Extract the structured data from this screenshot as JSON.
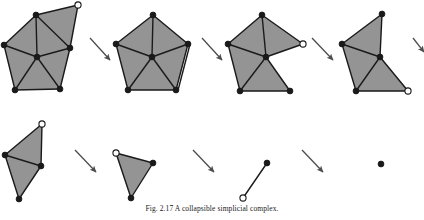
{
  "figure": {
    "caption": "Fig. 2.17  A collapsible simplicial complex.",
    "caption_clipped": true,
    "background": "#ffffff",
    "face_fill": "#949494",
    "edge_color": "#1a1a1a",
    "vertex_fill_color": "#1a1a1a",
    "vertex_hollow_fill": "#ffffff",
    "arrow_color": "#4d4d4d"
  },
  "panels": [
    {
      "name": "panel-1",
      "label": "step-1",
      "vertices": [
        {
          "id": "v-top-apex",
          "x": 36,
          "y": 15,
          "type": "filled"
        },
        {
          "id": "v-free-top-right",
          "x": 78,
          "y": 5,
          "type": "hollow"
        },
        {
          "id": "v-right",
          "x": 70,
          "y": 48,
          "type": "filled"
        },
        {
          "id": "v-left",
          "x": 4,
          "y": 45,
          "type": "filled"
        },
        {
          "id": "v-center",
          "x": 37,
          "y": 57,
          "type": "filled"
        },
        {
          "id": "v-bottom-left",
          "x": 15,
          "y": 90,
          "type": "filled"
        },
        {
          "id": "v-bottom-right",
          "x": 60,
          "y": 89,
          "type": "filled"
        }
      ],
      "faces": [
        [
          "v-top-apex",
          "v-free-top-right",
          "v-right"
        ],
        [
          "v-top-apex",
          "v-left",
          "v-center"
        ],
        [
          "v-top-apex",
          "v-center",
          "v-right"
        ],
        [
          "v-left",
          "v-center",
          "v-bottom-left"
        ],
        [
          "v-center",
          "v-bottom-left",
          "v-bottom-right"
        ],
        [
          "v-center",
          "v-bottom-right",
          "v-right"
        ]
      ],
      "edges": [
        [
          "v-top-apex",
          "v-free-top-right"
        ],
        [
          "v-free-top-right",
          "v-right"
        ],
        [
          "v-top-apex",
          "v-left"
        ],
        [
          "v-top-apex",
          "v-center"
        ],
        [
          "v-top-apex",
          "v-right"
        ],
        [
          "v-left",
          "v-center"
        ],
        [
          "v-center",
          "v-right"
        ],
        [
          "v-left",
          "v-bottom-left"
        ],
        [
          "v-center",
          "v-bottom-left"
        ],
        [
          "v-center",
          "v-bottom-right"
        ],
        [
          "v-bottom-left",
          "v-bottom-right"
        ],
        [
          "v-bottom-right",
          "v-right"
        ]
      ]
    },
    {
      "name": "panel-2",
      "label": "step-2",
      "vertices": [
        {
          "id": "v-top-apex",
          "x": 153,
          "y": 15,
          "type": "filled"
        },
        {
          "id": "v-right",
          "x": 188,
          "y": 44,
          "type": "filled"
        },
        {
          "id": "v-left",
          "x": 116,
          "y": 44,
          "type": "filled"
        },
        {
          "id": "v-center",
          "x": 152,
          "y": 57,
          "type": "filled"
        },
        {
          "id": "v-bottom-left",
          "x": 128,
          "y": 90,
          "type": "filled"
        },
        {
          "id": "v-bottom-right",
          "x": 176,
          "y": 90,
          "type": "filled"
        }
      ],
      "faces": [
        [
          "v-top-apex",
          "v-left",
          "v-center"
        ],
        [
          "v-top-apex",
          "v-center",
          "v-right"
        ],
        [
          "v-left",
          "v-center",
          "v-bottom-left"
        ],
        [
          "v-center",
          "v-bottom-left",
          "v-bottom-right"
        ],
        [
          "v-center",
          "v-bottom-right",
          "v-right"
        ]
      ],
      "edges": [
        [
          "v-top-apex",
          "v-left"
        ],
        [
          "v-top-apex",
          "v-center"
        ],
        [
          "v-top-apex",
          "v-right"
        ],
        [
          "v-left",
          "v-center"
        ],
        [
          "v-center",
          "v-right"
        ],
        [
          "v-left",
          "v-bottom-left"
        ],
        [
          "v-center",
          "v-bottom-left"
        ],
        [
          "v-center",
          "v-bottom-right"
        ],
        [
          "v-bottom-left",
          "v-bottom-right"
        ],
        [
          "v-bottom-right",
          "v-right"
        ]
      ],
      "double_edge": [
        "v-right",
        "v-bottom-right"
      ]
    },
    {
      "name": "panel-3",
      "label": "step-3",
      "vertices": [
        {
          "id": "v-top-apex",
          "x": 262,
          "y": 15,
          "type": "filled"
        },
        {
          "id": "v-free-right",
          "x": 303,
          "y": 44,
          "type": "hollow"
        },
        {
          "id": "v-left",
          "x": 228,
          "y": 44,
          "type": "filled"
        },
        {
          "id": "v-center",
          "x": 266,
          "y": 57,
          "type": "filled"
        },
        {
          "id": "v-bottom-left",
          "x": 240,
          "y": 91,
          "type": "filled"
        },
        {
          "id": "v-bottom-right",
          "x": 290,
          "y": 91,
          "type": "filled"
        }
      ],
      "faces": [
        [
          "v-top-apex",
          "v-left",
          "v-center"
        ],
        [
          "v-top-apex",
          "v-center",
          "v-free-right"
        ],
        [
          "v-left",
          "v-center",
          "v-bottom-left"
        ],
        [
          "v-center",
          "v-bottom-left",
          "v-bottom-right"
        ]
      ],
      "edges": [
        [
          "v-top-apex",
          "v-left"
        ],
        [
          "v-top-apex",
          "v-center"
        ],
        [
          "v-top-apex",
          "v-free-right"
        ],
        [
          "v-left",
          "v-center"
        ],
        [
          "v-center",
          "v-free-right"
        ],
        [
          "v-left",
          "v-bottom-left"
        ],
        [
          "v-center",
          "v-bottom-left"
        ],
        [
          "v-center",
          "v-bottom-right"
        ],
        [
          "v-bottom-left",
          "v-bottom-right"
        ]
      ]
    },
    {
      "name": "panel-4",
      "label": "step-4",
      "vertices": [
        {
          "id": "v-top-apex",
          "x": 382,
          "y": 14,
          "type": "filled"
        },
        {
          "id": "v-left",
          "x": 342,
          "y": 44,
          "type": "filled"
        },
        {
          "id": "v-center",
          "x": 380,
          "y": 57,
          "type": "filled"
        },
        {
          "id": "v-bottom-left",
          "x": 356,
          "y": 91,
          "type": "filled"
        },
        {
          "id": "v-free-bottom-right",
          "x": 408,
          "y": 91,
          "type": "hollow"
        }
      ],
      "faces": [
        [
          "v-top-apex",
          "v-left",
          "v-center"
        ],
        [
          "v-left",
          "v-center",
          "v-bottom-left"
        ],
        [
          "v-center",
          "v-bottom-left",
          "v-free-bottom-right"
        ]
      ],
      "edges": [
        [
          "v-top-apex",
          "v-left"
        ],
        [
          "v-top-apex",
          "v-center"
        ],
        [
          "v-left",
          "v-center"
        ],
        [
          "v-left",
          "v-bottom-left"
        ],
        [
          "v-center",
          "v-bottom-left"
        ],
        [
          "v-center",
          "v-free-bottom-right"
        ],
        [
          "v-bottom-left",
          "v-free-bottom-right"
        ]
      ]
    },
    {
      "name": "panel-5",
      "label": "step-5",
      "vertices": [
        {
          "id": "v-free-top",
          "x": 42,
          "y": 124,
          "type": "hollow"
        },
        {
          "id": "v-left",
          "x": 5,
          "y": 155,
          "type": "filled"
        },
        {
          "id": "v-center",
          "x": 41,
          "y": 166,
          "type": "filled"
        },
        {
          "id": "v-bottom",
          "x": 19,
          "y": 199,
          "type": "filled"
        }
      ],
      "faces": [
        [
          "v-free-top",
          "v-left",
          "v-center"
        ],
        [
          "v-left",
          "v-center",
          "v-bottom"
        ]
      ],
      "edges": [
        [
          "v-free-top",
          "v-left"
        ],
        [
          "v-free-top",
          "v-center"
        ],
        [
          "v-left",
          "v-center"
        ],
        [
          "v-left",
          "v-bottom"
        ],
        [
          "v-center",
          "v-bottom"
        ]
      ]
    },
    {
      "name": "panel-6",
      "label": "step-6",
      "vertices": [
        {
          "id": "v-free-left",
          "x": 116,
          "y": 153,
          "type": "hollow"
        },
        {
          "id": "v-right",
          "x": 153,
          "y": 163,
          "type": "filled"
        },
        {
          "id": "v-bottom",
          "x": 131,
          "y": 198,
          "type": "filled"
        }
      ],
      "faces": [
        [
          "v-free-left",
          "v-right",
          "v-bottom"
        ]
      ],
      "edges": [
        [
          "v-free-left",
          "v-right"
        ],
        [
          "v-free-left",
          "v-bottom"
        ],
        [
          "v-right",
          "v-bottom"
        ]
      ]
    },
    {
      "name": "panel-7",
      "label": "step-7",
      "vertices": [
        {
          "id": "v-top",
          "x": 267,
          "y": 163,
          "type": "filled"
        },
        {
          "id": "v-bottom",
          "x": 243,
          "y": 198,
          "type": "hollow"
        }
      ],
      "faces": [],
      "edges": [
        [
          "v-top",
          "v-bottom"
        ]
      ]
    },
    {
      "name": "panel-8",
      "label": "step-8",
      "vertices": [
        {
          "id": "v-point",
          "x": 381,
          "y": 164,
          "type": "filled"
        }
      ],
      "faces": [],
      "edges": []
    }
  ],
  "arrows": [
    {
      "name": "arrow-1",
      "from": [
        90,
        38
      ],
      "to": [
        110,
        60
      ]
    },
    {
      "name": "arrow-2",
      "from": [
        202,
        38
      ],
      "to": [
        222,
        60
      ]
    },
    {
      "name": "arrow-3",
      "from": [
        312,
        38
      ],
      "to": [
        333,
        60
      ]
    },
    {
      "name": "arrow-4",
      "from": [
        413,
        38
      ],
      "to": [
        424,
        52
      ]
    },
    {
      "name": "arrow-5",
      "from": [
        75,
        150
      ],
      "to": [
        96,
        172
      ]
    },
    {
      "name": "arrow-6",
      "from": [
        193,
        150
      ],
      "to": [
        214,
        172
      ]
    },
    {
      "name": "arrow-7",
      "from": [
        302,
        150
      ],
      "to": [
        323,
        172
      ]
    }
  ]
}
